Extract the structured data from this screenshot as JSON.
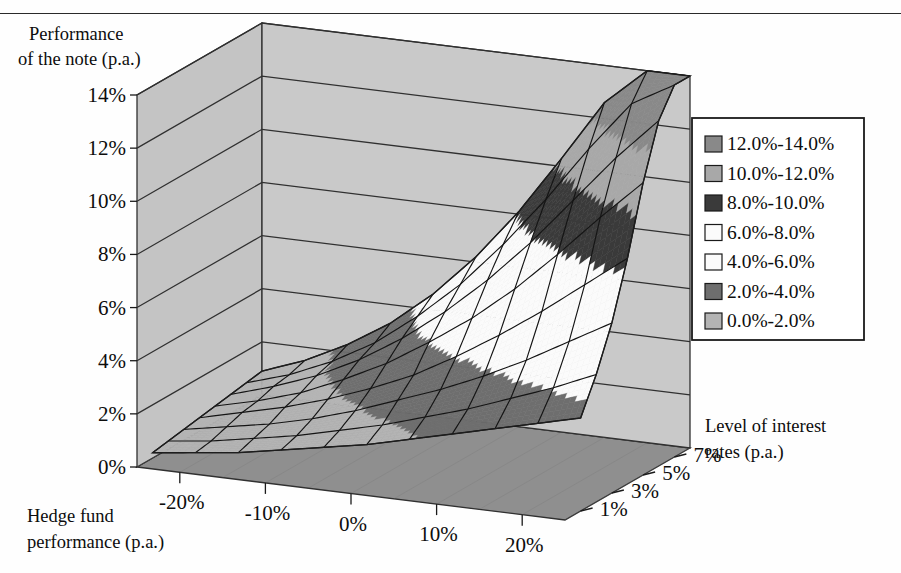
{
  "figure": {
    "kind": "3d-surface-chart",
    "z_axis_title_line1": "Performance",
    "z_axis_title_line2": "of the note (p.a.)",
    "x_axis_title_line1": "Hedge fund",
    "x_axis_title_line2": "performance (p.a.)",
    "y_axis_title_line1": "Level of interest",
    "y_axis_title_line2": "rates (p.a.)"
  },
  "axes": {
    "z_ticks": [
      "0%",
      "2%",
      "4%",
      "6%",
      "8%",
      "10%",
      "12%",
      "14%"
    ],
    "z_values": [
      0,
      2,
      4,
      6,
      8,
      10,
      12,
      14
    ],
    "x_ticks": [
      "-20%",
      "-10%",
      "0%",
      "10%",
      "20%"
    ],
    "x_values": [
      -20,
      -10,
      0,
      10,
      20
    ],
    "y_ticks": [
      "1%",
      "3%",
      "5%",
      "7%"
    ],
    "y_values": [
      1,
      3,
      5,
      7
    ]
  },
  "legend": {
    "border_color": "#1a1a1a",
    "items": [
      {
        "label": "12.0%-14.0%",
        "color": "#898989"
      },
      {
        "label": "10.0%-12.0%",
        "color": "#a8a8a8"
      },
      {
        "label": "8.0%-10.0%",
        "color": "#3a3a3a"
      },
      {
        "label": "6.0%-8.0%",
        "color": "#fbfbfb"
      },
      {
        "label": "4.0%-6.0%",
        "color": "#fbfbfb"
      },
      {
        "label": "2.0%-4.0%",
        "color": "#6e6e6e"
      },
      {
        "label": "0.0%-2.0%",
        "color": "#b4b4b4"
      }
    ]
  },
  "palette": {
    "back_wall": "#c9c9c9",
    "left_wall": "#c4c4c4",
    "floor": "#8f8f8f",
    "floor_front": "#7d7d7d",
    "grid_line": "#303030",
    "mesh_line": "#141414",
    "page_background": "#fefefe",
    "text": "#0d0d0d"
  },
  "chart_data": {
    "type": "surface",
    "title": "",
    "xlabel": "Hedge fund performance (p.a.)",
    "ylabel": "Level of interest rates (p.a.)",
    "zlabel": "Performance of the note (p.a.)",
    "xlim": [
      -25,
      25
    ],
    "ylim": [
      0,
      8
    ],
    "zlim": [
      0,
      14
    ],
    "grid": true,
    "legend_position": "right",
    "contour_bands": [
      {
        "range": [
          0,
          2
        ],
        "label": "0.0%-2.0%",
        "color": "#b4b4b4"
      },
      {
        "range": [
          2,
          4
        ],
        "label": "2.0%-4.0%",
        "color": "#6e6e6e"
      },
      {
        "range": [
          4,
          6
        ],
        "label": "4.0%-6.0%",
        "color": "#fbfbfb"
      },
      {
        "range": [
          6,
          8
        ],
        "label": "6.0%-8.0%",
        "color": "#fbfbfb"
      },
      {
        "range": [
          8,
          10
        ],
        "label": "8.0%-10.0%",
        "color": "#3a3a3a"
      },
      {
        "range": [
          10,
          12
        ],
        "label": "10.0%-12.0%",
        "color": "#a8a8a8"
      },
      {
        "range": [
          12,
          14
        ],
        "label": "12.0%-14.0%",
        "color": "#898989"
      }
    ],
    "x": [
      -25,
      -20,
      -15,
      -10,
      -5,
      0,
      5,
      10,
      15,
      20,
      25
    ],
    "y": [
      1,
      2,
      3,
      4,
      5,
      6,
      7,
      8
    ],
    "z_comment": "z[yIndex][xIndex] = performance of the note (% p.a.)",
    "z": [
      [
        0.2,
        0.4,
        0.6,
        0.9,
        1.2,
        1.5,
        1.9,
        2.3,
        2.7,
        3.1,
        3.5
      ],
      [
        0.3,
        0.5,
        0.8,
        1.1,
        1.5,
        1.9,
        2.4,
        2.9,
        3.5,
        4.1,
        4.8
      ],
      [
        0.4,
        0.7,
        1.0,
        1.4,
        1.9,
        2.5,
        3.1,
        3.8,
        4.6,
        5.5,
        6.4
      ],
      [
        0.5,
        0.9,
        1.3,
        1.8,
        2.4,
        3.1,
        4.0,
        5.0,
        6.1,
        7.3,
        8.5
      ],
      [
        0.6,
        1.0,
        1.5,
        2.2,
        3.0,
        4.0,
        5.1,
        6.4,
        7.9,
        9.5,
        11.0
      ],
      [
        0.7,
        1.2,
        1.8,
        2.6,
        3.6,
        4.8,
        6.2,
        7.8,
        9.6,
        11.4,
        13.0
      ],
      [
        0.8,
        1.3,
        2.0,
        2.9,
        4.1,
        5.5,
        7.2,
        9.1,
        11.2,
        13.1,
        14.0
      ],
      [
        0.9,
        1.5,
        2.3,
        3.3,
        4.6,
        6.2,
        8.1,
        10.3,
        12.6,
        14.0,
        14.0
      ]
    ]
  }
}
